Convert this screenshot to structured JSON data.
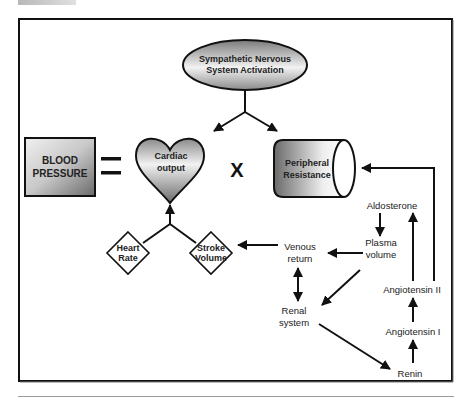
{
  "diagram": {
    "nodes": {
      "sympathetic": {
        "line1": "Sympathetic Nervous",
        "line2": "System Activation"
      },
      "blood_pressure": {
        "line1": "BLOOD",
        "line2": "PRESSURE"
      },
      "equals": "=",
      "cardiac_output": {
        "line1": "Cardiac",
        "line2": "output"
      },
      "multiply": "X",
      "peripheral_resistance": {
        "line1": "Peripheral",
        "line2": "Resistance"
      },
      "heart_rate": {
        "line1": "Heart",
        "line2": "Rate"
      },
      "stroke_volume": {
        "line1": "Stroke",
        "line2": "Volume"
      },
      "venous_return": {
        "line1": "Venous",
        "line2": "return"
      },
      "plasma_volume": {
        "line1": "Plasma",
        "line2": "volume"
      },
      "aldosterone": "Aldosterone",
      "renal_system": {
        "line1": "Renal",
        "line2": "system"
      },
      "angiotensin_ii": "Angiotensin II",
      "angiotensin_i": "Angiotensin I",
      "renin": "Renin"
    },
    "edges": [
      {
        "from": "Sympathetic Nervous System Activation",
        "to": "Cardiac output"
      },
      {
        "from": "Sympathetic Nervous System Activation",
        "to": "Peripheral Resistance"
      },
      {
        "from": "Heart Rate",
        "to": "Cardiac output"
      },
      {
        "from": "Stroke Volume",
        "to": "Cardiac output"
      },
      {
        "from": "Venous return",
        "to": "Stroke Volume"
      },
      {
        "from": "Plasma volume",
        "to": "Venous return"
      },
      {
        "from": "Aldosterone",
        "to": "Plasma volume"
      },
      {
        "from": "Plasma volume",
        "to": "Renal system"
      },
      {
        "from": "Venous return",
        "to": "Renal system",
        "bidirectional": true
      },
      {
        "from": "Renal system",
        "to": "Renin"
      },
      {
        "from": "Renin",
        "to": "Angiotensin I"
      },
      {
        "from": "Angiotensin I",
        "to": "Angiotensin II"
      },
      {
        "from": "Angiotensin II",
        "to": "Aldosterone"
      },
      {
        "from": "Angiotensin II",
        "to": "Peripheral Resistance"
      }
    ],
    "colors": {
      "stroke": "#111111",
      "gradient_dark": "#6e6e6e",
      "gradient_light": "#f4f4f4",
      "background": "#ffffff"
    }
  }
}
